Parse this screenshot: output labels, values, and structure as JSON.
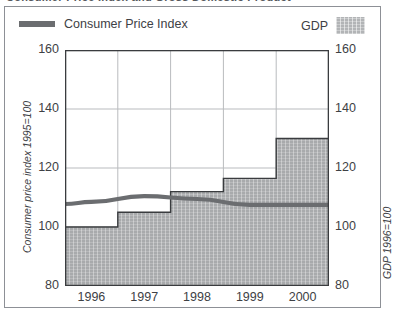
{
  "clipped_title": "Consumer Price Index and Gross Domestic Product",
  "legend": {
    "cpi_label": "Consumer Price Index",
    "gdp_label": "GDP",
    "cpi_swatch_name": "line-swatch",
    "gdp_swatch_name": "area-swatch"
  },
  "axis_titles": {
    "left": "Consumer price index 1995=100",
    "right": "GDP 1996=100"
  },
  "colors": {
    "cpi_line": "#6b6d70",
    "gdp_fill": "#a8aaac",
    "grid": "#b9bbbe",
    "axis": "#3a3c3f",
    "panel": "#ffffff",
    "frame": "#8d9096",
    "text": "#3e4145"
  },
  "chart_data": {
    "type": "area",
    "title": "Consumer Price Index and Gross Domestic Product",
    "xlabel": "",
    "ylabel": "Consumer price index 1995=100",
    "y2label": "GDP 1996=100",
    "categories": [
      "1996",
      "1997",
      "1998",
      "1999",
      "2000"
    ],
    "y_ticks": [
      80,
      100,
      120,
      140,
      160
    ],
    "y2_ticks": [
      80,
      100,
      120,
      140,
      160
    ],
    "ylim": [
      80,
      160
    ],
    "y2lim": [
      80,
      160
    ],
    "grid": true,
    "legend_position": "top",
    "series": [
      {
        "name": "GDP",
        "type": "step-area",
        "axis": "right",
        "baseline": 80,
        "values": [
          100,
          105,
          112,
          116.5,
          130
        ]
      },
      {
        "name": "Consumer Price Index",
        "type": "line",
        "axis": "left",
        "values": [
          108.5,
          110.5,
          109.5,
          107.5,
          107.5
        ]
      }
    ]
  }
}
